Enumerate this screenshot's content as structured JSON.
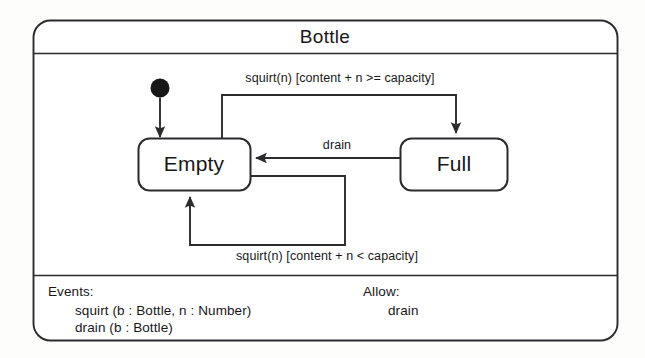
{
  "diagram": {
    "kind": "uml-statechart",
    "class_title": "Bottle",
    "line_color": "#2b2b2e",
    "fill_color": "#ffffff",
    "background_color": "#fdfdfb",
    "states": [
      {
        "id": "empty",
        "label": "Empty"
      },
      {
        "id": "full",
        "label": "Full"
      }
    ],
    "initial_state": {
      "name": "initial-pseudostate",
      "target": "Empty"
    },
    "transitions": [
      {
        "id": "empty-to-full",
        "from": "Empty",
        "to": "Full",
        "label": "squirt(n) [content + n >= capacity]",
        "event": "squirt(n)",
        "guard": "[content + n >= capacity]"
      },
      {
        "id": "full-to-empty",
        "from": "Full",
        "to": "Empty",
        "label": "drain",
        "event": "drain",
        "guard": ""
      },
      {
        "id": "empty-self",
        "from": "Empty",
        "to": "Empty",
        "label": "squirt(n) [content + n < capacity]",
        "event": "squirt(n)",
        "guard": "[content + n < capacity]"
      }
    ],
    "compartments": {
      "events": {
        "heading": "Events:",
        "items": [
          "squirt (b : Bottle, n : Number)",
          "drain (b : Bottle)"
        ]
      },
      "allow": {
        "heading": "Allow:",
        "items": [
          "drain"
        ]
      }
    }
  }
}
